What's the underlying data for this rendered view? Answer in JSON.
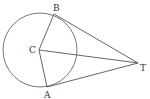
{
  "diagram": {
    "type": "geometry",
    "labels": {
      "A": "A",
      "B": "B",
      "C": "C",
      "T": "T"
    },
    "points": {
      "C": [
        39,
        50
      ],
      "A": [
        47,
        87
      ],
      "B": [
        54,
        14
      ],
      "T": [
        138,
        63
      ]
    },
    "circle": {
      "center": "C",
      "radius": 37
    },
    "segments": [
      [
        "C",
        "A"
      ],
      [
        "C",
        "B"
      ],
      [
        "C",
        "T"
      ],
      [
        "A",
        "T"
      ],
      [
        "B",
        "T"
      ]
    ],
    "stroke_color": "#555555"
  }
}
